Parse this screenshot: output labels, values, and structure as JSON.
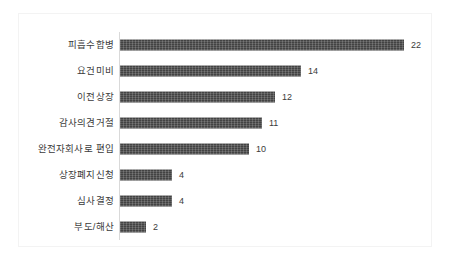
{
  "chart_data": {
    "type": "bar",
    "orientation": "horizontal",
    "title": "",
    "subtitle": "",
    "xlabel": "",
    "ylabel": "",
    "xlim": [
      0,
      22
    ],
    "grid": false,
    "legend": null,
    "legend_position": "none",
    "bar_color": "#4a4a4a",
    "axis_color": "#d9d9d9",
    "text_color": "#3b3b3b",
    "background_color": "#ffffff",
    "categories": [
      "피흡수합병",
      "요건미비",
      "이전상장",
      "감사의견거절",
      "완전자회사로 편입",
      "상장폐지신청",
      "심사결정",
      "부도/해산"
    ],
    "values": [
      22,
      14,
      12,
      11,
      10,
      4,
      4,
      2
    ],
    "value_labels": [
      "22",
      "14",
      "12",
      "11",
      "10",
      "4",
      "4",
      "2"
    ],
    "series": [
      {
        "name": "",
        "values": [
          22,
          14,
          12,
          11,
          10,
          4,
          4,
          2
        ]
      }
    ],
    "tick_labels": {
      "y": [
        "피흡수합병",
        "요건미비",
        "이전상장",
        "감사의견거절",
        "완전자회사로 편입",
        "상장폐지신청",
        "심사결정",
        "부도/해산"
      ],
      "x": []
    },
    "annotations": []
  },
  "rows": [
    {
      "label": "피흡수합병",
      "value": 22,
      "value_label": "22"
    },
    {
      "label": "요건미비",
      "value": 14,
      "value_label": "14"
    },
    {
      "label": "이전상장",
      "value": 12,
      "value_label": "12"
    },
    {
      "label": "감사의견거절",
      "value": 11,
      "value_label": "11"
    },
    {
      "label": "완전자회사로 편입",
      "value": 10,
      "value_label": "10"
    },
    {
      "label": "상장폐지신청",
      "value": 4,
      "value_label": "4"
    },
    {
      "label": "심사결정",
      "value": 4,
      "value_label": "4"
    },
    {
      "label": "부도/해산",
      "value": 2,
      "value_label": "2"
    }
  ]
}
